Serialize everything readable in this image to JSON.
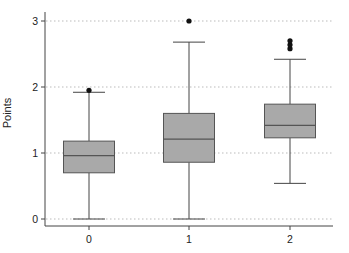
{
  "chart_data": {
    "type": "box",
    "title": "",
    "xlabel": "",
    "ylabel": "Points",
    "ylim": [
      0,
      3
    ],
    "yticks": [
      0,
      1,
      2,
      3
    ],
    "xticks": [
      "0",
      "1",
      "2"
    ],
    "grid": "horizontal dotted",
    "legend": null,
    "colors": {
      "box_fill": "#a9a9a9",
      "box_edge": "#555555",
      "whisker": "#444444",
      "outlier": "#111111",
      "grid": "#bbbbbb"
    },
    "categories": [
      "0",
      "1",
      "2"
    ],
    "boxes": [
      {
        "category": "0",
        "whisker_low": 0.0,
        "q1": 0.7,
        "median": 0.96,
        "q3": 1.18,
        "whisker_high": 1.92,
        "outliers": [
          1.95
        ]
      },
      {
        "category": "1",
        "whisker_low": 0.0,
        "q1": 0.86,
        "median": 1.21,
        "q3": 1.6,
        "whisker_high": 2.68,
        "outliers": [
          3.0
        ]
      },
      {
        "category": "2",
        "whisker_low": 0.54,
        "q1": 1.23,
        "median": 1.42,
        "q3": 1.74,
        "whisker_high": 2.42,
        "outliers": [
          2.58,
          2.64,
          2.7
        ]
      }
    ]
  }
}
